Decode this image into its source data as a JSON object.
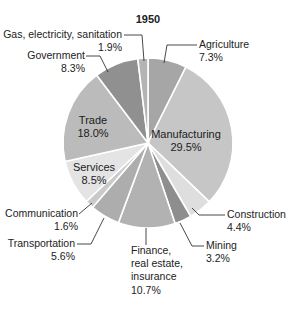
{
  "chart_data": {
    "type": "pie",
    "title": "1950",
    "xlabel": "",
    "ylabel": "",
    "legend": "none (direct labels)",
    "start": "top, clockwise",
    "categories": [
      "Agriculture",
      "Manufacturing",
      "Construction",
      "Mining",
      "Finance, real estate, insurance",
      "Transportation",
      "Communication",
      "Services",
      "Trade",
      "Government",
      "Gas, electricity, sanitation"
    ],
    "values": [
      7.3,
      29.5,
      4.4,
      3.2,
      10.7,
      5.6,
      1.6,
      8.5,
      18.0,
      8.3,
      1.9
    ],
    "value_labels": [
      "7.3%",
      "29.5%",
      "4.4%",
      "3.2%",
      "10.7%",
      "5.6%",
      "1.6%",
      "8.5%",
      "18.0%",
      "8.3%",
      "1.9%"
    ],
    "colors": [
      "#a6a6a6",
      "#c6c6c6",
      "#dedede",
      "#8e8e8e",
      "#b2b2b2",
      "#adadad",
      "#cacaca",
      "#e4e4e4",
      "#bbbbbb",
      "#909090",
      "#b4b4b4"
    ]
  },
  "geometry": {
    "cx": 148,
    "cy": 143,
    "r": 85
  },
  "labels": [
    {
      "lines": [
        "Agriculture",
        "7.3%"
      ],
      "x": 199,
      "y": 48,
      "anchor": "start",
      "leader": [
        [
          197,
          45
        ],
        [
          167,
          45
        ],
        [
          164,
          63
        ]
      ]
    },
    {
      "lines": [
        "Manufacturing",
        "29.5%"
      ],
      "x": 186,
      "y": 138,
      "anchor": "middle",
      "inside": true
    },
    {
      "lines": [
        "Construction",
        "4.4%"
      ],
      "x": 227,
      "y": 218,
      "anchor": "start",
      "leader": [
        [
          225,
          215
        ],
        [
          199,
          215
        ],
        [
          192,
          208
        ]
      ]
    },
    {
      "lines": [
        "Mining",
        "3.2%"
      ],
      "x": 206,
      "y": 249,
      "anchor": "start",
      "leader": [
        [
          204,
          246
        ],
        [
          192,
          246
        ],
        [
          180,
          223
        ]
      ]
    },
    {
      "lines": [
        "Finance,",
        "real estate,",
        "insurance",
        "10.7%"
      ],
      "x": 131,
      "y": 254,
      "anchor": "start",
      "leader": [
        [
          146,
          228
        ],
        [
          146,
          245
        ]
      ]
    },
    {
      "lines": [
        "Transportation",
        "5.6%"
      ],
      "x": 75,
      "y": 247,
      "anchor": "end",
      "leader": [
        [
          77,
          244
        ],
        [
          91,
          244
        ],
        [
          104,
          218
        ]
      ]
    },
    {
      "lines": [
        "Communication",
        "1.6%"
      ],
      "x": 78,
      "y": 217,
      "anchor": "end",
      "leader": [
        [
          79,
          214
        ],
        [
          92,
          203
        ]
      ]
    },
    {
      "lines": [
        "Services",
        "8.5%"
      ],
      "x": 94,
      "y": 171,
      "anchor": "middle",
      "inside": true
    },
    {
      "lines": [
        "Trade",
        "18.0%"
      ],
      "x": 93,
      "y": 124,
      "anchor": "middle",
      "inside": true
    },
    {
      "lines": [
        "Government",
        "8.3%"
      ],
      "x": 85,
      "y": 59,
      "anchor": "end",
      "leader": [
        [
          86,
          56
        ],
        [
          100,
          56
        ],
        [
          108,
          72
        ]
      ]
    },
    {
      "lines": [
        "Gas, electricity, sanitation",
        "1.9%"
      ],
      "x": 122,
      "y": 38,
      "anchor": "end",
      "leader": [
        [
          124,
          35
        ],
        [
          142,
          35
        ],
        [
          144,
          61
        ]
      ]
    }
  ],
  "title_pos": {
    "x": 148,
    "y": 23
  }
}
